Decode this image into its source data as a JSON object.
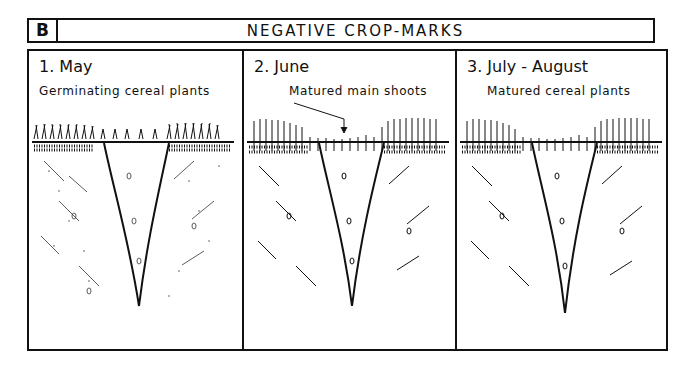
{
  "header": {
    "label": "B",
    "title": "NEGATIVE CROP-MARKS"
  },
  "panels": [
    {
      "title": "1. May",
      "caption": "Germinating cereal plants"
    },
    {
      "title": "2. June",
      "caption": "Matured main shoots"
    },
    {
      "title": "3. July - August",
      "caption": "Matured cereal plants"
    }
  ],
  "colors": {
    "ink": "#111111",
    "paper": "#ffffff"
  }
}
